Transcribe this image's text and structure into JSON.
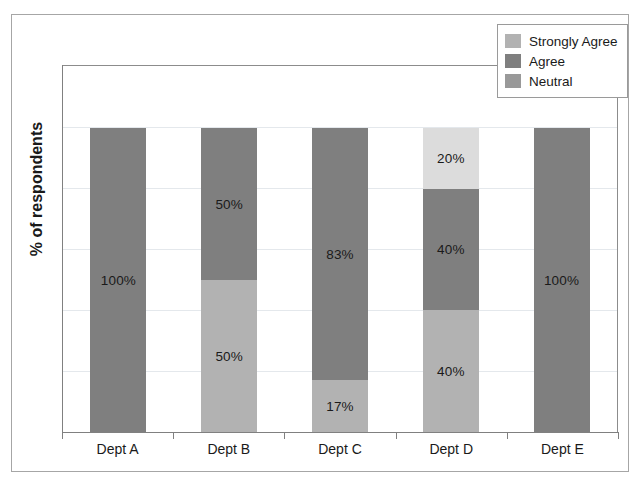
{
  "chart_data": {
    "type": "bar",
    "subtype": "stacked-bar-100-percent",
    "title": "",
    "xlabel": "",
    "ylabel": "% of respondents",
    "ylim": [
      0,
      100
    ],
    "grid": true,
    "gridline_count": 5,
    "legend_position": "top-right",
    "categories": [
      "Dept A",
      "Dept B",
      "Dept C",
      "Dept D",
      "Dept E"
    ],
    "series": [
      {
        "name": "Strongly Agree",
        "color": "#b2b2b2",
        "values": [
          0,
          50,
          17,
          40,
          0
        ],
        "labels": [
          "",
          "50%",
          "17%",
          "40%",
          ""
        ]
      },
      {
        "name": "Agree",
        "color": "#7f7f7f",
        "values": [
          100,
          50,
          83,
          40,
          100
        ],
        "labels": [
          "100%",
          "50%",
          "83%",
          "40%",
          "100%"
        ]
      },
      {
        "name": "Neutral",
        "color": "#dcdcdc",
        "values": [
          0,
          0,
          0,
          20,
          0
        ],
        "labels": [
          "",
          "",
          "",
          "20%",
          ""
        ]
      }
    ],
    "stack_order_bottom_to_top": [
      "Strongly Agree",
      "Agree",
      "Neutral"
    ],
    "bars": [
      {
        "category": "Dept A",
        "total": 100,
        "segments": [
          {
            "series": "Agree",
            "value": 100,
            "label": "100%",
            "color": "#7f7f7f"
          }
        ]
      },
      {
        "category": "Dept B",
        "total": 100,
        "segments": [
          {
            "series": "Strongly Agree",
            "value": 50,
            "label": "50%",
            "color": "#b2b2b2"
          },
          {
            "series": "Agree",
            "value": 50,
            "label": "50%",
            "color": "#7f7f7f"
          }
        ]
      },
      {
        "category": "Dept C",
        "total": 100,
        "segments": [
          {
            "series": "Strongly Agree",
            "value": 17,
            "label": "17%",
            "color": "#b2b2b2"
          },
          {
            "series": "Agree",
            "value": 83,
            "label": "83%",
            "color": "#7f7f7f"
          }
        ]
      },
      {
        "category": "Dept D",
        "total": 100,
        "segments": [
          {
            "series": "Strongly Agree",
            "value": 40,
            "label": "40%",
            "color": "#b2b2b2"
          },
          {
            "series": "Agree",
            "value": 40,
            "label": "40%",
            "color": "#7f7f7f"
          },
          {
            "series": "Neutral",
            "value": 20,
            "label": "20%",
            "color": "#dcdcdc"
          }
        ]
      },
      {
        "category": "Dept E",
        "total": 100,
        "segments": [
          {
            "series": "Agree",
            "value": 100,
            "label": "100%",
            "color": "#7f7f7f"
          }
        ]
      }
    ]
  },
  "legend": {
    "items": [
      {
        "label": "Strongly Agree",
        "color": "#b2b2b2"
      },
      {
        "label": "Agree",
        "color": "#7f7f7f"
      },
      {
        "label": "Neutral",
        "color": "#999999"
      }
    ]
  },
  "axis": {
    "y_title": "% of respondents",
    "x_categories": [
      "Dept A",
      "Dept B",
      "Dept C",
      "Dept D",
      "Dept E"
    ]
  }
}
